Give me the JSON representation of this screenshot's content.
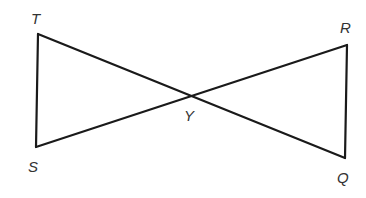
{
  "diagram": {
    "type": "geometry-figure",
    "points": {
      "T": {
        "label": "T",
        "x": 38,
        "y": 34
      },
      "S": {
        "label": "S",
        "x": 36,
        "y": 147
      },
      "Y": {
        "label": "Y",
        "x": 190,
        "y": 97
      },
      "R": {
        "label": "R",
        "x": 347,
        "y": 45
      },
      "Q": {
        "label": "Q",
        "x": 345,
        "y": 158
      }
    },
    "segments": [
      {
        "from": "T",
        "to": "S"
      },
      {
        "from": "T",
        "to": "Q"
      },
      {
        "from": "S",
        "to": "R"
      },
      {
        "from": "R",
        "to": "Q"
      }
    ],
    "labels": {
      "T": "T",
      "S": "S",
      "Y": "Y",
      "R": "R",
      "Q": "Q"
    },
    "line_color": "#1a1a1a",
    "label_color": "#333333"
  }
}
